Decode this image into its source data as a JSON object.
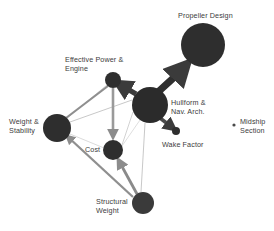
{
  "figure": {
    "background_color": "#ffffff",
    "node_color": "#2e2e2e",
    "edge_color_thick": "#4a4a4a",
    "edge_color_thin": "#b9b9b9",
    "label_color": "#3c3c3c"
  },
  "graph_data": {
    "type": "diagram",
    "title": "",
    "nodes": [
      {
        "id": "propeller_design",
        "label": "Propeller Design",
        "x": 203,
        "y": 45,
        "r": 22,
        "label_x": 178,
        "label_y": 12,
        "label_align": "left"
      },
      {
        "id": "hullform_nav_arch",
        "label": "Hullform &\nNav. Arch.",
        "x": 150,
        "y": 105,
        "r": 18,
        "label_x": 172,
        "label_y": 100,
        "label_align": "left"
      },
      {
        "id": "effective_power_engine",
        "label": "Effective Power &\nEngine",
        "x": 113,
        "y": 80,
        "r": 8,
        "label_x": 65,
        "label_y": 56,
        "label_align": "left"
      },
      {
        "id": "weight_stability",
        "label": "Weight &\nStability",
        "x": 57,
        "y": 128,
        "r": 14,
        "label_x": 8,
        "label_y": 118,
        "label_align": "left"
      },
      {
        "id": "cost",
        "label": "Cost",
        "x": 113,
        "y": 150,
        "r": 10,
        "label_x": 85,
        "label_y": 145,
        "label_align": "left"
      },
      {
        "id": "structural_weight",
        "label": "Structural\nWeight",
        "x": 143,
        "y": 203,
        "r": 11,
        "label_x": 97,
        "label_y": 198,
        "label_align": "left"
      },
      {
        "id": "wake_factor",
        "label": "Wake Factor",
        "x": 176,
        "y": 131,
        "r": 4,
        "label_x": 163,
        "label_y": 141,
        "label_align": "left"
      },
      {
        "id": "midship_section",
        "label": "Midship\nSection",
        "x": 234,
        "y": 125,
        "r": 1.5,
        "label_x": 239,
        "label_y": 119,
        "label_align": "left"
      }
    ],
    "edges": [
      {
        "from": "hullform_nav_arch",
        "to": "propeller_design",
        "weight": "thick",
        "arrow": true
      },
      {
        "from": "hullform_nav_arch",
        "to": "effective_power_engine",
        "weight": "thick",
        "arrow": true
      },
      {
        "from": "hullform_nav_arch",
        "to": "wake_factor",
        "weight": "thick",
        "arrow": true
      },
      {
        "from": "hullform_nav_arch",
        "to": "structural_weight",
        "weight": "thin",
        "arrow": false
      },
      {
        "from": "hullform_nav_arch",
        "to": "weight_stability",
        "weight": "thin",
        "arrow": false
      },
      {
        "from": "hullform_nav_arch",
        "to": "cost",
        "weight": "thin",
        "arrow": false
      },
      {
        "from": "effective_power_engine",
        "to": "cost",
        "weight": "medium",
        "arrow": true
      },
      {
        "from": "effective_power_engine",
        "to": "weight_stability",
        "weight": "medium",
        "arrow": false
      },
      {
        "from": "structural_weight",
        "to": "cost",
        "weight": "medium",
        "arrow": true
      },
      {
        "from": "structural_weight",
        "to": "weight_stability",
        "weight": "medium",
        "arrow": true
      },
      {
        "from": "weight_stability",
        "to": "structural_weight",
        "weight": "thin",
        "arrow": false
      }
    ]
  }
}
